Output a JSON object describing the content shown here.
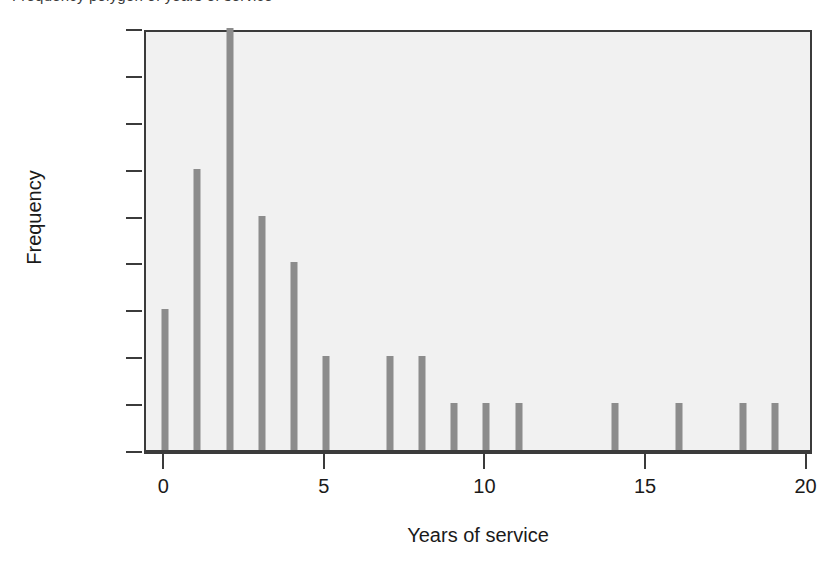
{
  "caption_fragment": "Frequency polygon of years of service",
  "chart_data": {
    "type": "bar",
    "title": "",
    "subtitle": "",
    "xlabel": "Years of service",
    "ylabel": "Frequency",
    "x": [
      0,
      1,
      2,
      3,
      4,
      5,
      7,
      8,
      9,
      10,
      11,
      14,
      16,
      18,
      19
    ],
    "values": [
      3,
      6,
      9,
      5,
      4,
      2,
      2,
      2,
      1,
      1,
      1,
      1,
      1,
      1,
      1
    ],
    "categories": [
      "0",
      "1",
      "2",
      "3",
      "4",
      "5",
      "7",
      "8",
      "9",
      "10",
      "11",
      "14",
      "16",
      "18",
      "19"
    ],
    "xlim": [
      -0.6,
      20.2
    ],
    "ylim": [
      0,
      9
    ],
    "x_ticks": [
      0,
      5,
      10,
      15,
      20
    ],
    "x_tick_labels": [
      "0",
      "5",
      "10",
      "15",
      "20"
    ],
    "y_ticks": [
      0,
      1,
      2,
      3,
      4,
      5,
      6,
      7,
      8,
      9
    ],
    "y_tick_labels": [
      "0",
      "1",
      "2",
      "3",
      "4",
      "5",
      "6",
      "7",
      "8",
      "9"
    ],
    "grid": false,
    "legend": null,
    "legend_position": "none",
    "bar_color": "#8c8c8c",
    "plot_background": "#f1f1f1",
    "axis_color": "#3b3b3b",
    "page_background": "#ffffff",
    "annotations": []
  }
}
